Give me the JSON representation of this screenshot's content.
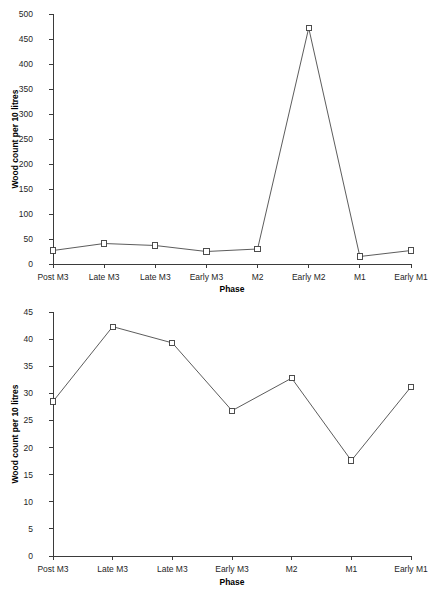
{
  "page": {
    "width": 441,
    "height": 600,
    "background": "#ffffff",
    "ink_color": "#3b3b3b",
    "marker_fill": "#ffffff"
  },
  "chart_data": [
    {
      "id": "top",
      "type": "line",
      "title": "",
      "xlabel": "Phase",
      "ylabel": "Wood count per 10 litres",
      "categories": [
        "Post M3",
        "Late M3",
        "Late M3",
        "Early M3",
        "M2",
        "Early M2",
        "M1",
        "Early M1"
      ],
      "values": [
        27,
        41,
        37,
        25,
        30,
        472,
        15,
        27
      ],
      "ylim": [
        0,
        500
      ],
      "yticks": [
        0,
        50,
        100,
        150,
        200,
        250,
        300,
        350,
        400,
        450,
        500
      ],
      "ytick_labels": [
        "0",
        "50",
        "100",
        "150",
        "200",
        "250",
        "300",
        "350",
        "400",
        "450",
        "500"
      ],
      "grid": false,
      "legend": false,
      "marker": "open-square"
    },
    {
      "id": "bottom",
      "type": "line",
      "title": "",
      "xlabel": "Phase",
      "ylabel": "Wood count per 10 litres",
      "categories": [
        "Post M3",
        "Late M3",
        "Late M3",
        "Early M3",
        "M2",
        "M1",
        "Early M1"
      ],
      "values": [
        28.5,
        42.3,
        39.3,
        26.8,
        32.8,
        17.6,
        31.2
      ],
      "ylim": [
        0,
        45
      ],
      "yticks": [
        0,
        5,
        10,
        15,
        20,
        25,
        30,
        35,
        40,
        45
      ],
      "ytick_labels": [
        "0",
        "5",
        "10",
        "15",
        "20",
        "25",
        "30",
        "35",
        "40",
        "45"
      ],
      "grid": false,
      "legend": false,
      "marker": "open-square"
    }
  ]
}
